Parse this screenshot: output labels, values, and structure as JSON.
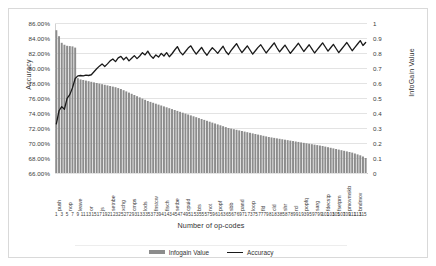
{
  "chart_data": {
    "type": "bar",
    "title": "",
    "subtitle": "",
    "xlabel": "Number of op-codes",
    "ylabel": "Accuracy",
    "y2label": "InfoGain Value",
    "ylim": [
      66,
      86
    ],
    "y2lim": [
      0,
      1
    ],
    "grid": true,
    "legend_position": "bottom",
    "y_ticks": [
      "66.00%",
      "68.00%",
      "70.00%",
      "72.00%",
      "74.00%",
      "76.00%",
      "78.00%",
      "80.00%",
      "82.00%",
      "84.00%",
      "86.00%"
    ],
    "y2_ticks": [
      "0",
      "0.1",
      "0.2",
      "0.3",
      "0.4",
      "0.5",
      "0.6",
      "0.7",
      "0.8",
      "0.9",
      "1"
    ],
    "x_tick_labels": [
      "1",
      "3",
      "5",
      "7",
      "9",
      "11",
      "13",
      "15",
      "17",
      "19",
      "21",
      "23",
      "25",
      "27",
      "29",
      "31",
      "33",
      "35",
      "37",
      "39",
      "41",
      "43",
      "45",
      "47",
      "49",
      "51",
      "53",
      "55",
      "57",
      "59",
      "61",
      "63",
      "65",
      "67",
      "69",
      "71",
      "73",
      "75",
      "77",
      "79",
      "81",
      "83",
      "85",
      "87",
      "89",
      "91",
      "93",
      "95",
      "97",
      "99",
      "101",
      "103",
      "105",
      "107",
      "109",
      "111",
      "113",
      "115"
    ],
    "opcode_labels": [
      "push",
      "nop",
      "leave",
      "or",
      "js",
      "setnbe",
      "xchg",
      "cmps",
      "lods",
      "fnstcw",
      "fisch",
      "setbe",
      "cpuid",
      "bts",
      "not",
      "popf",
      "sbb",
      "pand",
      "loop",
      "fld",
      "cld",
      "shr",
      "rcl",
      "popfq",
      "sarg",
      "fdecstp",
      "fsetpm",
      "pmovmskb",
      "bndmov"
    ],
    "series": [
      {
        "name": "Infogain Value",
        "type": "bar",
        "axis": "right",
        "color": "#8c8c8c",
        "values": [
          0.952,
          0.912,
          0.868,
          0.855,
          0.848,
          0.846,
          0.844,
          0.836,
          0.632,
          0.624,
          0.62,
          0.616,
          0.612,
          0.608,
          0.604,
          0.6,
          0.596,
          0.592,
          0.588,
          0.584,
          0.58,
          0.576,
          0.572,
          0.566,
          0.56,
          0.552,
          0.544,
          0.536,
          0.528,
          0.52,
          0.512,
          0.504,
          0.496,
          0.488,
          0.48,
          0.474,
          0.468,
          0.462,
          0.456,
          0.45,
          0.444,
          0.438,
          0.432,
          0.426,
          0.42,
          0.414,
          0.408,
          0.402,
          0.396,
          0.39,
          0.384,
          0.378,
          0.372,
          0.366,
          0.36,
          0.354,
          0.348,
          0.342,
          0.336,
          0.33,
          0.324,
          0.318,
          0.312,
          0.306,
          0.3,
          0.296,
          0.292,
          0.288,
          0.284,
          0.28,
          0.276,
          0.272,
          0.268,
          0.264,
          0.26,
          0.256,
          0.252,
          0.248,
          0.244,
          0.24,
          0.237,
          0.234,
          0.231,
          0.228,
          0.225,
          0.222,
          0.219,
          0.216,
          0.213,
          0.21,
          0.207,
          0.204,
          0.201,
          0.198,
          0.195,
          0.192,
          0.189,
          0.186,
          0.183,
          0.18,
          0.176,
          0.172,
          0.168,
          0.164,
          0.16,
          0.156,
          0.152,
          0.148,
          0.144,
          0.14,
          0.136,
          0.13,
          0.124,
          0.118,
          0.11,
          0.1
        ]
      },
      {
        "name": "Accuracy",
        "type": "line",
        "axis": "left",
        "color": "#1a1a1a",
        "values": [
          72.55,
          74.3,
          74.85,
          74.5,
          75.95,
          76.45,
          77.35,
          78.6,
          78.95,
          79.0,
          78.95,
          79.05,
          79.0,
          79.1,
          79.5,
          79.9,
          80.25,
          80.55,
          80.2,
          80.55,
          80.95,
          81.2,
          80.85,
          81.35,
          81.55,
          81.1,
          81.45,
          80.95,
          81.3,
          81.65,
          81.25,
          81.6,
          82.05,
          81.75,
          82.25,
          81.65,
          81.3,
          81.75,
          81.45,
          81.95,
          81.6,
          82.05,
          81.5,
          81.9,
          82.4,
          82.85,
          82.15,
          81.75,
          82.2,
          82.65,
          82.95,
          82.35,
          81.85,
          82.3,
          82.75,
          82.15,
          81.7,
          82.25,
          82.7,
          82.35,
          81.95,
          82.45,
          82.9,
          82.2,
          81.8,
          82.35,
          82.8,
          83.25,
          82.6,
          82.05,
          82.5,
          82.95,
          82.4,
          81.85,
          82.3,
          82.75,
          83.1,
          82.55,
          82.0,
          82.45,
          82.9,
          83.35,
          82.7,
          82.15,
          82.6,
          83.05,
          82.5,
          81.95,
          82.4,
          82.85,
          83.3,
          82.75,
          82.2,
          82.65,
          83.1,
          82.55,
          82.0,
          82.45,
          82.9,
          83.35,
          82.8,
          82.25,
          82.7,
          83.15,
          82.6,
          82.05,
          82.5,
          82.95,
          83.4,
          82.85,
          82.3,
          82.75,
          83.2,
          83.65,
          83.0,
          83.4
        ]
      }
    ],
    "legend": [
      {
        "label": "Infogain Value",
        "marker": "bar"
      },
      {
        "label": "Accuracy",
        "marker": "line"
      }
    ]
  }
}
